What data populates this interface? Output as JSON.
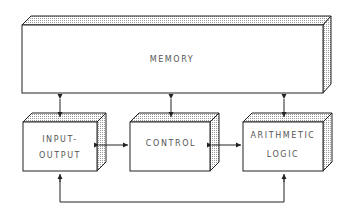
{
  "diagram": {
    "title": "",
    "nodes": [
      {
        "id": "memory",
        "label_lines": [
          "MEMORY"
        ]
      },
      {
        "id": "input-output",
        "label_lines": [
          "INPUT-",
          "OUTPUT"
        ]
      },
      {
        "id": "control",
        "label_lines": [
          "CONTROL"
        ]
      },
      {
        "id": "arithmetic-logic",
        "label_lines": [
          "ARITHMETIC",
          "LOGIC"
        ]
      }
    ],
    "edges": [
      {
        "from": "memory",
        "to": "input-output",
        "direction": "bidirectional"
      },
      {
        "from": "memory",
        "to": "control",
        "direction": "bidirectional"
      },
      {
        "from": "memory",
        "to": "arithmetic-logic",
        "direction": "bidirectional"
      },
      {
        "from": "input-output",
        "to": "control",
        "direction": "bidirectional"
      },
      {
        "from": "control",
        "to": "arithmetic-logic",
        "direction": "bidirectional"
      },
      {
        "from": "input-output",
        "to": "arithmetic-logic",
        "direction": "bidirectional",
        "route": "bottom-loop"
      }
    ]
  }
}
